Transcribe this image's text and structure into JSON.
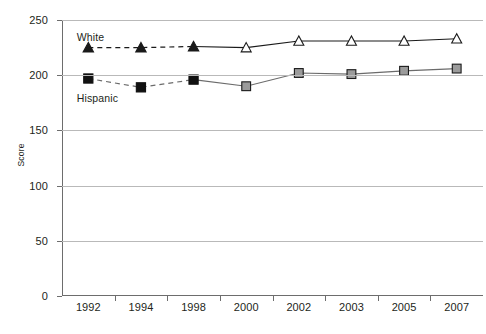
{
  "chart_data": {
    "type": "line",
    "title": "",
    "xlabel": "",
    "ylabel": "Score",
    "categories": [
      "1992",
      "1994",
      "1998",
      "2000",
      "2002",
      "2003",
      "2005",
      "2007"
    ],
    "ylim": [
      0,
      250
    ],
    "yticks": [
      0,
      50,
      100,
      150,
      200,
      250
    ],
    "ytick_labels": [
      "0",
      "50",
      "100",
      "150",
      "200",
      "250"
    ],
    "grid": true,
    "legend_position": "inline-annotations",
    "series": [
      {
        "name": "White",
        "values": [
          225,
          225,
          226,
          225,
          231,
          231,
          231,
          233
        ],
        "marker": "triangle",
        "filled_through_index": 2,
        "fill_color": "#1a1a1a",
        "open_fill_color": "#ffffff",
        "line_color": "#1a1a1a",
        "dash_through_index": 2,
        "label_x_pct": 3.5,
        "label_y_pct": 4
      },
      {
        "name": "Hispanic",
        "values": [
          197,
          189,
          196,
          190,
          202,
          201,
          204,
          206
        ],
        "marker": "square",
        "filled_through_index": 2,
        "fill_color": "#111111",
        "open_fill_color": "#9b9b9b",
        "line_color": "#6b6b6b",
        "dash_through_index": 2,
        "label_x_pct": 3.5,
        "label_y_pct": 26
      }
    ],
    "colors": {
      "grid": "#b9b9b9",
      "axis": "#6d6d6d",
      "text": "#231f20",
      "white_series": "#1a1a1a",
      "hispanic_series": "#9b9b9b",
      "background": "#ffffff"
    }
  }
}
